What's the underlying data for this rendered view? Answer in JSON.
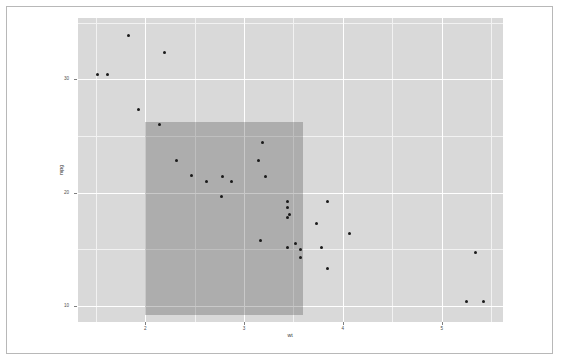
{
  "chart_data": {
    "type": "scatter",
    "title": "",
    "subtitle": "",
    "xlabel": "wt",
    "ylabel": "mpg",
    "xlim": [
      1.32,
      5.62
    ],
    "ylim": [
      8.6,
      35.4
    ],
    "grid": true,
    "legend": null,
    "legend_position": "none",
    "xticks": [
      2,
      3,
      4,
      5
    ],
    "xtick_labels": [
      "2",
      "3",
      "4",
      "5"
    ],
    "yticks": [
      10,
      20,
      30
    ],
    "ytick_labels": [
      "10",
      "20",
      "30"
    ],
    "x_minor_ticks": [
      1.5,
      2.5,
      3.5,
      4.5,
      5.5
    ],
    "y_minor_ticks": [
      15,
      25,
      35
    ],
    "point_color": "#1a1a1a",
    "panel_background": "#d9d9d9",
    "gridline_major_color": "#ffffff",
    "gridline_minor_color": "#f2f2f2",
    "plot_background": "#ffffff",
    "frame_color": "#b8b8b8",
    "annotation": {
      "kind": "rect",
      "label": "highlight-rect",
      "xmin": 2,
      "xmax": 3.6,
      "ymin": 9.2,
      "ymax": 26.2,
      "fill": "#3c3c3c",
      "alpha": 0.28
    },
    "x": [
      2.62,
      2.875,
      2.32,
      3.215,
      3.44,
      3.46,
      3.57,
      3.19,
      3.15,
      3.44,
      3.44,
      4.07,
      3.73,
      3.78,
      5.25,
      5.424,
      5.345,
      2.2,
      1.615,
      1.835,
      2.465,
      3.52,
      3.435,
      3.84,
      3.845,
      1.935,
      2.14,
      1.513,
      3.17,
      2.77,
      3.57,
      2.78
    ],
    "y": [
      21,
      21,
      22.8,
      21.4,
      18.7,
      18.1,
      14.3,
      24.4,
      22.8,
      19.2,
      17.8,
      16.4,
      17.3,
      15.2,
      10.4,
      10.4,
      14.7,
      32.4,
      30.4,
      33.9,
      21.5,
      15.5,
      15.2,
      13.3,
      19.2,
      27.3,
      26,
      30.4,
      15.8,
      19.7,
      15,
      21.4
    ]
  }
}
